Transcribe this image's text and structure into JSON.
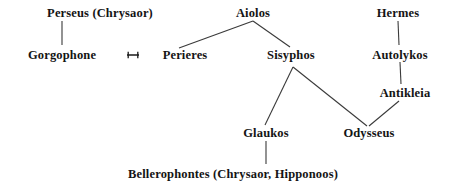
{
  "diagram": {
    "type": "genealogy-family-tree",
    "title": "",
    "background_color": "#ffffff",
    "text_color": "#141414",
    "line_color": "#3a3a3a",
    "width": 459,
    "height": 190,
    "nodes": [
      {
        "id": "perseus",
        "label": "Perseus (Chrysaor)",
        "x": 100,
        "y": 13
      },
      {
        "id": "aiolos",
        "label": "Aiolos",
        "x": 253,
        "y": 13
      },
      {
        "id": "hermes",
        "label": "Hermes",
        "x": 398,
        "y": 13
      },
      {
        "id": "gorgophone",
        "label": "Gorgophone",
        "x": 62,
        "y": 55
      },
      {
        "id": "perieres",
        "label": "Perieres",
        "x": 185,
        "y": 55
      },
      {
        "id": "sisyphos",
        "label": "Sisyphos",
        "x": 291,
        "y": 55
      },
      {
        "id": "autolykos",
        "label": "Autolykos",
        "x": 400,
        "y": 55
      },
      {
        "id": "antikleia",
        "label": "Antikleia",
        "x": 405,
        "y": 93
      },
      {
        "id": "glaukos",
        "label": "Glaukos",
        "x": 266,
        "y": 133
      },
      {
        "id": "odysseus",
        "label": "Odysseus",
        "x": 369,
        "y": 133
      },
      {
        "id": "bellerophontes",
        "label": "Bellerophontes (Chrysaor, Hipponoos)",
        "x": 233,
        "y": 174
      }
    ],
    "edges": [
      {
        "id": "perseus-gorgophone",
        "from": "perseus",
        "to": "gorgophone",
        "kind": "descent"
      },
      {
        "id": "aiolos-perieres",
        "from": "aiolos",
        "to": "perieres",
        "kind": "descent"
      },
      {
        "id": "aiolos-sisyphos",
        "from": "aiolos",
        "to": "sisyphos",
        "kind": "descent"
      },
      {
        "id": "hermes-autolykos",
        "from": "hermes",
        "to": "autolykos",
        "kind": "descent"
      },
      {
        "id": "autolykos-antikleia",
        "from": "autolykos",
        "to": "antikleia",
        "kind": "descent"
      },
      {
        "id": "sisyphos-glaukos",
        "from": "sisyphos",
        "to": "glaukos",
        "kind": "descent"
      },
      {
        "id": "sisyphos-odysseus",
        "from": "sisyphos",
        "to": "odysseus",
        "kind": "descent"
      },
      {
        "id": "antikleia-odysseus",
        "from": "antikleia",
        "to": "odysseus",
        "kind": "descent"
      },
      {
        "id": "glaukos-bellerophontes",
        "from": "glaukos",
        "to": "bellerophontes",
        "kind": "descent"
      }
    ],
    "unions": [
      {
        "id": "gorgophone-perieres-union",
        "between": [
          "gorgophone",
          "perieres"
        ],
        "symbol": "marriage-symbol",
        "x": 133,
        "y": 55
      }
    ]
  }
}
